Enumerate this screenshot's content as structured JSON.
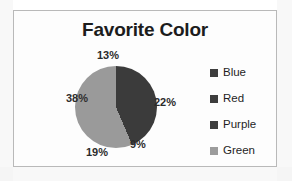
{
  "chart_data": {
    "type": "pie",
    "title": "Favorite Color",
    "xlabel": "",
    "ylabel": "",
    "legend_position": "right",
    "grid": false,
    "categories": [
      "Blue",
      "Red",
      "Purple",
      "Green"
    ],
    "labels": [
      "13%",
      "22%",
      "9%",
      "19%",
      "38%"
    ],
    "slices": [
      {
        "label": "13%",
        "value": 13,
        "color": "#3b3b3b"
      },
      {
        "label": "22%",
        "value": 22,
        "color": "#3b3b3b"
      },
      {
        "label": "9%",
        "value": 9,
        "color": "#3b3b3b"
      },
      {
        "label": "19%",
        "value": 19,
        "color": "#9a9a9a"
      },
      {
        "label": "38%",
        "value": 38,
        "color": "#9a9a9a"
      }
    ],
    "legend_entries": [
      {
        "name": "Blue",
        "color": "#3d3d3d"
      },
      {
        "name": "Red",
        "color": "#3d3d3d"
      },
      {
        "name": "Purple",
        "color": "#3d3d3d"
      },
      {
        "name": "Green",
        "color": "#9c9c9c"
      }
    ]
  },
  "chart": {
    "title": "Favorite Color",
    "border_color": "#b9b9b9",
    "background": "#fdfdfd"
  }
}
